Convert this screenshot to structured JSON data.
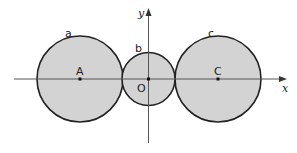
{
  "diagram": {
    "axes": {
      "x_label": "x",
      "y_label": "y",
      "origin_label": "O"
    },
    "circles": [
      {
        "name": "a",
        "center_label": "A",
        "cx": 80,
        "cy": 79,
        "r": 43
      },
      {
        "name": "b",
        "center_label": "O",
        "cx": 148.5,
        "cy": 79,
        "r": 26
      },
      {
        "name": "c",
        "center_label": "C",
        "cx": 218,
        "cy": 79,
        "r": 43
      }
    ],
    "colors": {
      "fill": "#d3d3d3",
      "stroke": "#222222",
      "axis": "#555555"
    }
  }
}
